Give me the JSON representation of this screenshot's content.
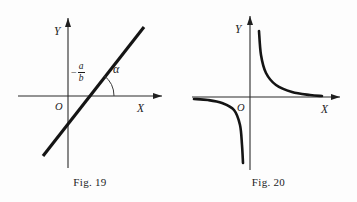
{
  "page": {
    "background_color": "#fdfdfd",
    "ink_color": "#141414",
    "width": 357,
    "height": 202
  },
  "figures": [
    {
      "caption": "Fig. 19",
      "kind": "linear-function-graph",
      "axes": {
        "x_label": "X",
        "y_label": "Y",
        "origin_label": "O",
        "x_axis_y": 96,
        "y_axis_x": 68,
        "x_axis_from": 18,
        "x_axis_to": 162,
        "y_axis_from": 168,
        "y_axis_to": 18
      },
      "annotations": {
        "x_intercept_label": {
          "minus": "−",
          "numerator": "a",
          "denominator": "b"
        },
        "angle_label": "α"
      },
      "chart_data": {
        "type": "line",
        "title": "Fig. 19",
        "xlabel": "X",
        "ylabel": "Y",
        "grid": false,
        "legend": "none",
        "description": "Straight line y = bx + a crossing the X axis at x = -a/b with inclination angle alpha",
        "line_endpoints": [
          [
            43,
            156
          ],
          [
            144,
            27
          ]
        ],
        "x_intercept_px": [
          88,
          96
        ],
        "y_intercept_px": [
          68,
          124
        ],
        "angle_arc_radius": 26,
        "angle_degrees": 52
      }
    },
    {
      "caption": "Fig. 20",
      "kind": "hyperbola-graph",
      "axes": {
        "x_label": "X",
        "y_label": "Y",
        "origin_label": "O",
        "x_axis_y": 97,
        "y_axis_x": 250,
        "x_axis_from": 192,
        "x_axis_to": 340,
        "y_axis_from": 170,
        "y_axis_to": 16
      },
      "annotations": {},
      "chart_data": {
        "type": "line",
        "title": "Fig. 20",
        "xlabel": "X",
        "ylabel": "Y",
        "grid": false,
        "legend": "none",
        "description": "Rectangular hyperbola y = k/x with branches in the first and third quadrants, asymptotic to both axes",
        "branch_upper_right_px": [
          [
            259,
            31
          ],
          [
            261,
            55
          ],
          [
            266,
            73
          ],
          [
            276,
            85
          ],
          [
            292,
            92
          ],
          [
            310,
            95
          ],
          [
            322,
            96
          ]
        ],
        "branch_lower_left_px": [
          [
            194,
            99
          ],
          [
            208,
            100
          ],
          [
            222,
            103
          ],
          [
            234,
            110
          ],
          [
            240,
            125
          ],
          [
            242,
            145
          ],
          [
            243,
            163
          ]
        ]
      }
    }
  ]
}
